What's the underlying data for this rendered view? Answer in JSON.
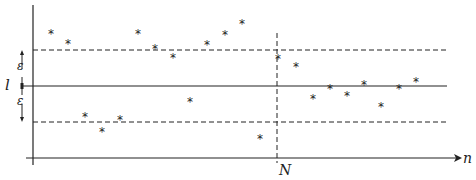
{
  "diagram": {
    "labels": {
      "limit": "l",
      "epsilon_upper": "ε",
      "epsilon_lower": "ε",
      "x_axis": "n",
      "threshold": "N"
    },
    "colors": {
      "ink": "#222222",
      "background": "#ffffff"
    },
    "geometry": {
      "y_axis_x": 33,
      "x_axis_y": 158,
      "limit_y": 86,
      "upper_band_y": 50,
      "lower_band_y": 122,
      "N_x": 277
    },
    "points": [
      {
        "x": 51,
        "y": 32
      },
      {
        "x": 68,
        "y": 42
      },
      {
        "x": 85,
        "y": 115
      },
      {
        "x": 102,
        "y": 130
      },
      {
        "x": 120,
        "y": 118
      },
      {
        "x": 138,
        "y": 32
      },
      {
        "x": 155,
        "y": 47
      },
      {
        "x": 173,
        "y": 56
      },
      {
        "x": 190,
        "y": 100
      },
      {
        "x": 207,
        "y": 43
      },
      {
        "x": 225,
        "y": 33
      },
      {
        "x": 242,
        "y": 22
      },
      {
        "x": 260,
        "y": 137
      },
      {
        "x": 278,
        "y": 57
      },
      {
        "x": 296,
        "y": 65
      },
      {
        "x": 313,
        "y": 97
      },
      {
        "x": 330,
        "y": 87
      },
      {
        "x": 347,
        "y": 94
      },
      {
        "x": 364,
        "y": 83
      },
      {
        "x": 381,
        "y": 105
      },
      {
        "x": 399,
        "y": 87
      },
      {
        "x": 416,
        "y": 80
      }
    ],
    "point_marker": "*"
  }
}
